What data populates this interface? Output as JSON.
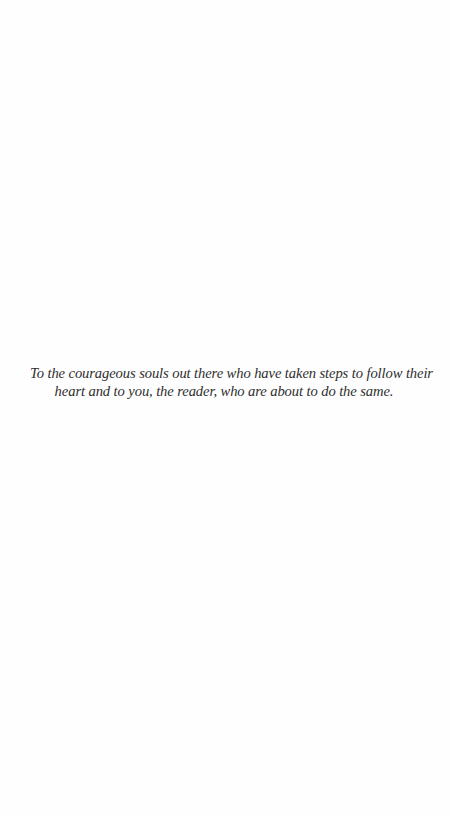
{
  "page": {
    "type": "dedication",
    "lines": [
      "To the courageous souls out there who have taken steps to follow their",
      "heart and to you, the reader, who are about to do the same."
    ]
  }
}
